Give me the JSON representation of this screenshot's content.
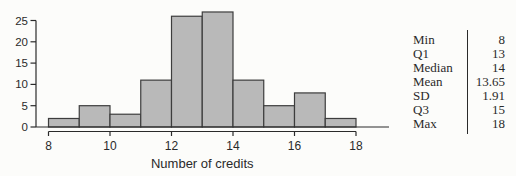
{
  "chart_data": {
    "type": "bar",
    "variant": "histogram",
    "title": "",
    "xlabel": "Number of credits",
    "ylabel": "",
    "bin_edges": [
      8,
      9,
      10,
      11,
      12,
      13,
      14,
      15,
      16,
      17,
      18
    ],
    "counts": [
      2,
      5,
      3,
      11,
      26,
      27,
      11,
      5,
      8,
      2
    ],
    "x_ticks": [
      8,
      10,
      12,
      14,
      16,
      18
    ],
    "y_ticks": [
      0,
      5,
      10,
      15,
      20,
      25
    ],
    "xlim": [
      8,
      18
    ],
    "ylim": [
      0,
      25
    ],
    "grid": false,
    "legend": false,
    "bar_fill": "#b9b9b9",
    "bar_stroke": "#3d3d3d",
    "axis_color": "#2a2a2a"
  },
  "stats_table": {
    "rows": [
      {
        "label": "Min",
        "value": "8"
      },
      {
        "label": "Q1",
        "value": "13"
      },
      {
        "label": "Median",
        "value": "14"
      },
      {
        "label": "Mean",
        "value": "13.65"
      },
      {
        "label": "SD",
        "value": "1.91"
      },
      {
        "label": "Q3",
        "value": "15"
      },
      {
        "label": "Max",
        "value": "18"
      }
    ]
  }
}
